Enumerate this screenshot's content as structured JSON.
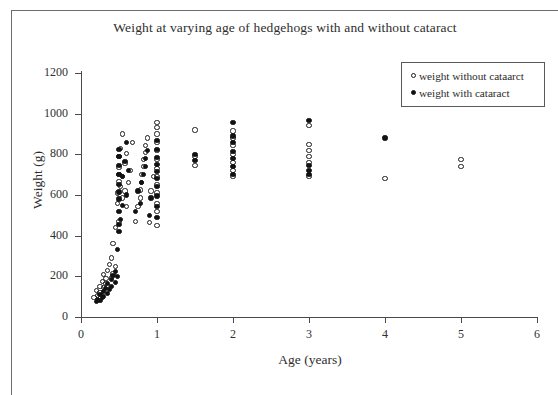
{
  "chart_data": {
    "type": "scatter",
    "title": "Weight at varying age of hedgehogs with and without cataract",
    "xlabel": "Age (years)",
    "ylabel": "Weight (g)",
    "xlim": [
      0,
      6
    ],
    "ylim": [
      0,
      1200
    ],
    "xticks": [
      0,
      1,
      2,
      3,
      4,
      5,
      6
    ],
    "yticks": [
      0,
      200,
      400,
      600,
      800,
      1000,
      1200
    ],
    "grid": false,
    "legend_position": "top-right",
    "legend": [
      {
        "label": "weight without cataarct",
        "marker": "open-circle"
      },
      {
        "label": "weight with cataract",
        "marker": "filled-circle"
      }
    ],
    "series": [
      {
        "name": "weight without cataarct",
        "marker": "open-circle",
        "points": [
          [
            0.17,
            95
          ],
          [
            0.2,
            130
          ],
          [
            0.22,
            105
          ],
          [
            0.25,
            120
          ],
          [
            0.25,
            150
          ],
          [
            0.28,
            175
          ],
          [
            0.3,
            210
          ],
          [
            0.3,
            145
          ],
          [
            0.32,
            165
          ],
          [
            0.33,
            190
          ],
          [
            0.35,
            230
          ],
          [
            0.35,
            155
          ],
          [
            0.38,
            260
          ],
          [
            0.4,
            290
          ],
          [
            0.4,
            195
          ],
          [
            0.42,
            360
          ],
          [
            0.42,
            215
          ],
          [
            0.45,
            440
          ],
          [
            0.45,
            250
          ],
          [
            0.48,
            560
          ],
          [
            0.48,
            610
          ],
          [
            0.5,
            470
          ],
          [
            0.5,
            665
          ],
          [
            0.5,
            700
          ],
          [
            0.5,
            735
          ],
          [
            0.5,
            790
          ],
          [
            0.52,
            640
          ],
          [
            0.52,
            830
          ],
          [
            0.55,
            585
          ],
          [
            0.55,
            900
          ],
          [
            0.55,
            690
          ],
          [
            0.58,
            755
          ],
          [
            0.58,
            620
          ],
          [
            0.6,
            805
          ],
          [
            0.6,
            545
          ],
          [
            0.62,
            660
          ],
          [
            0.65,
            720
          ],
          [
            0.68,
            860
          ],
          [
            0.72,
            470
          ],
          [
            0.75,
            545
          ],
          [
            0.78,
            585
          ],
          [
            0.78,
            625
          ],
          [
            0.8,
            660
          ],
          [
            0.8,
            700
          ],
          [
            0.82,
            740
          ],
          [
            0.82,
            775
          ],
          [
            0.85,
            810
          ],
          [
            0.85,
            845
          ],
          [
            0.88,
            880
          ],
          [
            0.9,
            465
          ],
          [
            0.92,
            620
          ],
          [
            0.95,
            690
          ],
          [
            1.0,
            450
          ],
          [
            1.0,
            520
          ],
          [
            1.0,
            560
          ],
          [
            1.0,
            610
          ],
          [
            1.0,
            650
          ],
          [
            1.0,
            690
          ],
          [
            1.0,
            730
          ],
          [
            1.0,
            775
          ],
          [
            1.0,
            820
          ],
          [
            1.0,
            860
          ],
          [
            1.0,
            900
          ],
          [
            1.0,
            930
          ],
          [
            1.0,
            955
          ],
          [
            1.5,
            920
          ],
          [
            1.5,
            790
          ],
          [
            1.5,
            745
          ],
          [
            2.0,
            690
          ],
          [
            2.0,
            720
          ],
          [
            2.0,
            760
          ],
          [
            2.0,
            800
          ],
          [
            2.0,
            845
          ],
          [
            2.0,
            880
          ],
          [
            2.0,
            915
          ],
          [
            3.0,
            690
          ],
          [
            3.0,
            760
          ],
          [
            3.0,
            790
          ],
          [
            3.0,
            820
          ],
          [
            3.0,
            850
          ],
          [
            3.0,
            940
          ],
          [
            4.0,
            680
          ],
          [
            5.0,
            740
          ],
          [
            5.0,
            775
          ]
        ]
      },
      {
        "name": "weight with cataract",
        "marker": "filled-circle",
        "points": [
          [
            0.2,
            75
          ],
          [
            0.22,
            88
          ],
          [
            0.25,
            80
          ],
          [
            0.25,
            110
          ],
          [
            0.28,
            95
          ],
          [
            0.3,
            125
          ],
          [
            0.3,
            100
          ],
          [
            0.32,
            140
          ],
          [
            0.35,
            115
          ],
          [
            0.35,
            165
          ],
          [
            0.38,
            135
          ],
          [
            0.4,
            185
          ],
          [
            0.4,
            150
          ],
          [
            0.42,
            205
          ],
          [
            0.45,
            170
          ],
          [
            0.45,
            225
          ],
          [
            0.48,
            330
          ],
          [
            0.48,
            200
          ],
          [
            0.5,
            420
          ],
          [
            0.5,
            455
          ],
          [
            0.5,
            520
          ],
          [
            0.5,
            580
          ],
          [
            0.5,
            615
          ],
          [
            0.5,
            650
          ],
          [
            0.5,
            700
          ],
          [
            0.5,
            745
          ],
          [
            0.5,
            790
          ],
          [
            0.5,
            825
          ],
          [
            0.52,
            480
          ],
          [
            0.55,
            550
          ],
          [
            0.55,
            690
          ],
          [
            0.58,
            765
          ],
          [
            0.6,
            600
          ],
          [
            0.6,
            860
          ],
          [
            0.62,
            720
          ],
          [
            0.72,
            520
          ],
          [
            0.75,
            620
          ],
          [
            0.78,
            560
          ],
          [
            0.8,
            660
          ],
          [
            0.82,
            700
          ],
          [
            0.85,
            740
          ],
          [
            0.85,
            780
          ],
          [
            0.88,
            820
          ],
          [
            0.9,
            500
          ],
          [
            0.92,
            585
          ],
          [
            1.0,
            490
          ],
          [
            1.0,
            545
          ],
          [
            1.0,
            595
          ],
          [
            1.0,
            640
          ],
          [
            1.0,
            680
          ],
          [
            1.0,
            715
          ],
          [
            1.0,
            750
          ],
          [
            1.0,
            785
          ],
          [
            1.0,
            825
          ],
          [
            1.0,
            870
          ],
          [
            1.5,
            770
          ],
          [
            1.5,
            800
          ],
          [
            2.0,
            700
          ],
          [
            2.0,
            740
          ],
          [
            2.0,
            780
          ],
          [
            2.0,
            815
          ],
          [
            2.0,
            860
          ],
          [
            2.0,
            890
          ],
          [
            2.0,
            955
          ],
          [
            3.0,
            700
          ],
          [
            3.0,
            720
          ],
          [
            3.0,
            745
          ],
          [
            3.0,
            965
          ],
          [
            4.0,
            880
          ]
        ]
      }
    ]
  }
}
